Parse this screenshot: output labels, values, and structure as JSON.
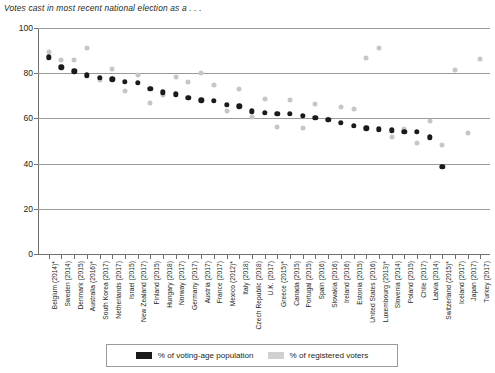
{
  "chart_data": {
    "type": "scatter",
    "title": "Votes cast in most recent national election as a . . .",
    "xlabel": "",
    "ylabel": "",
    "ylim": [
      0,
      100
    ],
    "yticks": [
      0,
      20,
      40,
      60,
      80,
      100
    ],
    "grid": "horizontal",
    "legend_position": "bottom",
    "categories": [
      "Belgium (2014)*",
      "Sweden (2014)",
      "Denmark (2015)",
      "Australia (2016)*",
      "South Korea (2017)",
      "Netherlands (2017)",
      "Israel (2015)",
      "New Zealand (2017)",
      "Finland (2015)",
      "Hungary (2018)",
      "Norway (2017)",
      "Germany (2017)",
      "Austria (2017)",
      "France (2017)",
      "Mexico (2012)*",
      "Italy (2018)",
      "Czech Republic (2018)",
      "U.K. (2017)",
      "Greece (2015)*",
      "Canada (2015)",
      "Portugal (2015)",
      "Spain (2016)",
      "Slovakia (2016)",
      "Ireland (2016)",
      "Estonia (2015)",
      "United States (2016)",
      "Luxembourg (2013)*",
      "Slovenia (2014)",
      "Poland (2015)",
      "Chile (2017)",
      "Latvia (2014)",
      "Switzerland (2015)*",
      "Iceland (2017)",
      "Japan (2017)",
      "Turkey (2017)"
    ],
    "series": [
      {
        "name": "% of voting-age population",
        "color": "#1a1a1a",
        "values": [
          87,
          82.6,
          80.8,
          79,
          77.9,
          77.3,
          76.1,
          75.7,
          73.1,
          71.6,
          70.6,
          69.1,
          68,
          67.9,
          66.0,
          65.3,
          63.2,
          62.6,
          62.1,
          62.1,
          61.1,
          60.3,
          59.4,
          58.0,
          56.8,
          55.7,
          55.1,
          54.8,
          54.2,
          54,
          51.6,
          38.6,
          null,
          null,
          null
        ]
      },
      {
        "name": "% of registered voters",
        "color": "#c6c6c6",
        "values": [
          89.4,
          85.8,
          85.9,
          91.0,
          77.2,
          81.9,
          72.3,
          79.0,
          66.9,
          70.2,
          78.2,
          76.2,
          80.0,
          74.6,
          63.1,
          73.0,
          60.8,
          68.8,
          56.2,
          68.3,
          55.8,
          66.5,
          59.7,
          65.1,
          64.2,
          86.8,
          91.1,
          51.7,
          55.3,
          49.0,
          58.9,
          48.4,
          81.2,
          53.7,
          86.2
        ]
      }
    ]
  },
  "legend": {
    "entries": [
      {
        "label": "% of voting-age population"
      },
      {
        "label": "% of registered voters"
      }
    ]
  }
}
